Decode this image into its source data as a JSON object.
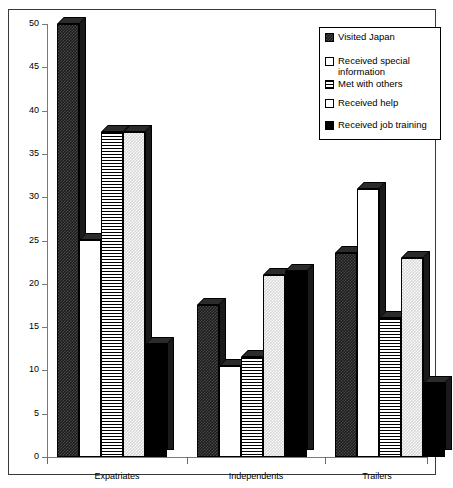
{
  "chart_data": {
    "type": "bar",
    "title": "",
    "xlabel": "",
    "ylabel": "",
    "ylim": [
      0,
      50
    ],
    "yticks": [
      0,
      5,
      10,
      15,
      20,
      25,
      30,
      35,
      40,
      45,
      50
    ],
    "grid": false,
    "legend_position": "top-right",
    "categories": [
      "Expatriates",
      "Independents",
      "Trailers"
    ],
    "series": [
      {
        "name": "Visited Japan",
        "pattern": "dense-checker",
        "values": [
          50,
          17.5,
          23.5
        ]
      },
      {
        "name": "Received special\ninformation",
        "pattern": "white",
        "values": [
          25,
          10.5,
          31
        ]
      },
      {
        "name": "Met with others",
        "pattern": "horizontal-lines",
        "values": [
          37.5,
          11.5,
          16
        ]
      },
      {
        "name": "Received help",
        "pattern": "light-checker",
        "values": [
          37.5,
          21,
          23
        ]
      },
      {
        "name": "Received job training",
        "pattern": "solid-black",
        "values": [
          13,
          21.5,
          8.5
        ]
      }
    ]
  },
  "legend": {
    "items": [
      {
        "label": "Visited Japan",
        "swatch": "dense-checker"
      },
      {
        "label": "Received special\ninformation",
        "swatch": "white"
      },
      {
        "label": "Met with others",
        "swatch": "horizontal-lines"
      },
      {
        "label": "Received help",
        "swatch": "white"
      },
      {
        "label": "Received job training",
        "swatch": "solid-black"
      }
    ]
  },
  "axis": {
    "y_tick_labels": [
      "0",
      "5",
      "10",
      "15",
      "20",
      "25",
      "30",
      "35",
      "40",
      "45",
      "50"
    ],
    "x_tick_labels": [
      "Expatriates",
      "Independents",
      "Trailers"
    ]
  },
  "colors": {
    "frame": "#3a3a3a",
    "axis": "#7a7a7a",
    "text": "#000000",
    "background": "#ffffff"
  }
}
